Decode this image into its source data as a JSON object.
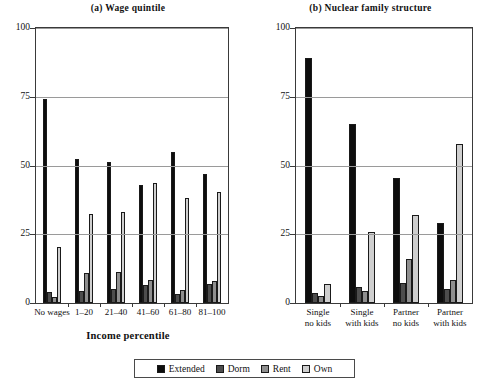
{
  "figure": {
    "axis_title": "Income percentile"
  },
  "legend": {
    "items": [
      {
        "label": "Extended",
        "color": "#0d0d0d",
        "key": "extended"
      },
      {
        "label": "Dorm",
        "color": "#4d4d4d",
        "key": "dorm"
      },
      {
        "label": "Rent",
        "color": "#8f8f8f",
        "key": "rent"
      },
      {
        "label": "Own",
        "color": "#cfcfcf",
        "key": "own"
      }
    ]
  },
  "chart_data": [
    {
      "type": "bar",
      "panel": "a",
      "title": "(a) Wage quintile",
      "xlabel": "Income percentile",
      "ylabel": "",
      "ylim": [
        0,
        100
      ],
      "yticks": [
        0,
        25,
        50,
        75,
        100
      ],
      "grid": true,
      "legend_position": "bottom",
      "categories": [
        "No wages",
        "1–20",
        "21–40",
        "41–60",
        "61–80",
        "81–100"
      ],
      "series": [
        {
          "name": "Extended",
          "color": "#0d0d0d",
          "values": [
            74.2,
            52.2,
            51.3,
            43.0,
            55.0,
            46.8
          ]
        },
        {
          "name": "Dorm",
          "color": "#4d4d4d",
          "values": [
            4.0,
            4.5,
            5.0,
            6.5,
            3.3,
            7.0
          ]
        },
        {
          "name": "Rent",
          "color": "#8f8f8f",
          "values": [
            2.2,
            11.0,
            11.3,
            8.2,
            4.8,
            8.0
          ]
        },
        {
          "name": "Own",
          "color": "#cfcfcf",
          "values": [
            20.5,
            32.5,
            33.0,
            43.8,
            38.2,
            40.5
          ]
        }
      ]
    },
    {
      "type": "bar",
      "panel": "b",
      "title": "(b) Nuclear family structure",
      "xlabel": "",
      "ylabel": "",
      "ylim": [
        0,
        100
      ],
      "yticks": [
        0,
        25,
        50,
        75,
        100
      ],
      "grid": true,
      "legend_position": "bottom",
      "categories": [
        "Single no kids",
        "Single with kids",
        "Partner no kids",
        "Partner with kids"
      ],
      "category_lines": [
        [
          "Single",
          "no kids"
        ],
        [
          "Single",
          "with kids"
        ],
        [
          "Partner",
          "no kids"
        ],
        [
          "Partner",
          "with kids"
        ]
      ],
      "series": [
        {
          "name": "Extended",
          "color": "#0d0d0d",
          "values": [
            89.0,
            65.0,
            45.5,
            29.0
          ]
        },
        {
          "name": "Dorm",
          "color": "#4d4d4d",
          "values": [
            3.8,
            5.8,
            7.2,
            5.2
          ]
        },
        {
          "name": "Rent",
          "color": "#8f8f8f",
          "values": [
            2.5,
            4.5,
            16.0,
            8.5
          ]
        },
        {
          "name": "Own",
          "color": "#cfcfcf",
          "values": [
            6.8,
            26.0,
            32.0,
            58.0
          ]
        }
      ]
    }
  ]
}
